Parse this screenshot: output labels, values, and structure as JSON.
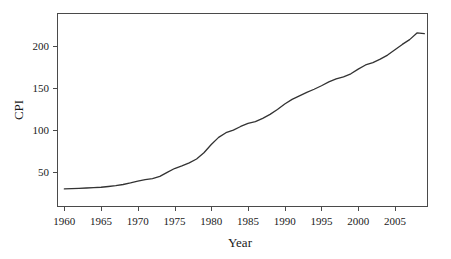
{
  "chart_data": {
    "type": "line",
    "title": "",
    "subtitle": "",
    "xlabel": "Year",
    "ylabel": "CPI",
    "xlim": [
      1959,
      2009.5
    ],
    "ylim": [
      8,
      239
    ],
    "grid": false,
    "legend": null,
    "line_color": "#333333",
    "background_color": "#ffffff",
    "axis_color": "#4a4a4a",
    "xticks": [
      1960,
      1965,
      1970,
      1975,
      1980,
      1985,
      1990,
      1995,
      2000,
      2005
    ],
    "xtick_labels": [
      "1960",
      "1965",
      "1970",
      "1975",
      "1980",
      "1985",
      "1990",
      "1995",
      "2000",
      "2005"
    ],
    "yticks": [
      50,
      100,
      150,
      200
    ],
    "ytick_labels": [
      "50",
      "100",
      "150",
      "200"
    ],
    "series": [
      {
        "name": "CPI",
        "x": [
          1960,
          1961,
          1962,
          1963,
          1964,
          1965,
          1966,
          1967,
          1968,
          1969,
          1970,
          1971,
          1972,
          1973,
          1974,
          1975,
          1976,
          1977,
          1978,
          1979,
          1980,
          1981,
          1982,
          1983,
          1984,
          1985,
          1986,
          1987,
          1988,
          1989,
          1990,
          1991,
          1992,
          1993,
          1994,
          1995,
          1996,
          1997,
          1998,
          1999,
          2000,
          2001,
          2002,
          2003,
          2004,
          2005,
          2006,
          2007,
          2008,
          2009
        ],
        "values": [
          29.6,
          29.9,
          30.2,
          30.6,
          31.0,
          31.5,
          32.4,
          33.4,
          34.8,
          36.7,
          38.8,
          40.5,
          41.8,
          44.4,
          49.3,
          53.8,
          56.9,
          60.6,
          65.2,
          72.6,
          82.4,
          90.9,
          96.5,
          99.6,
          103.9,
          107.6,
          109.6,
          113.6,
          118.3,
          124.0,
          130.7,
          136.2,
          140.3,
          144.5,
          148.2,
          152.4,
          156.9,
          160.5,
          163.0,
          166.6,
          172.2,
          177.1,
          179.9,
          184.0,
          188.9,
          195.3,
          201.6,
          207.3,
          215.3,
          214.5
        ]
      }
    ]
  }
}
